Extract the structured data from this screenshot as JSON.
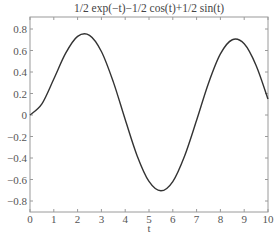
{
  "chart_data": {
    "type": "line",
    "title": "1/2 exp(−t)−1/2 cos(t)+1/2 sin(t)",
    "xlabel": "t",
    "ylabel": "",
    "xlim": [
      0,
      10
    ],
    "ylim": [
      -0.88,
      0.9
    ],
    "grid": false,
    "legend": null,
    "x_ticks": [
      0,
      1,
      2,
      3,
      4,
      5,
      6,
      7,
      8,
      9,
      10
    ],
    "x_tick_labels": [
      "0",
      "1",
      "2",
      "3",
      "4",
      "5",
      "6",
      "7",
      "8",
      "9",
      "10"
    ],
    "y_ticks": [
      0.8,
      0.6,
      0.4,
      0.2,
      0,
      -0.2,
      -0.4,
      -0.6,
      -0.8
    ],
    "y_tick_labels": [
      "0.8",
      "0.6",
      "0.4",
      "0.2",
      "0",
      "−0.2",
      "−0.4",
      "−0.6",
      "−0.8"
    ],
    "series": [
      {
        "name": "1/2 exp(-t)-1/2 cos(t)+1/2 sin(t)",
        "color": "#333333",
        "x": [
          0,
          0.5,
          1,
          1.5,
          2,
          2.5,
          3,
          3.5,
          4,
          4.5,
          5,
          5.5,
          6,
          6.5,
          7,
          7.5,
          8,
          8.5,
          9,
          9.5,
          10
        ],
        "y": [
          0,
          0.104,
          0.335,
          0.575,
          0.731,
          0.741,
          0.591,
          0.308,
          -0.042,
          -0.378,
          -0.618,
          -0.705,
          -0.619,
          -0.379,
          -0.049,
          0.296,
          0.568,
          0.7,
          0.662,
          0.461,
          0.148
        ]
      }
    ]
  },
  "layout": {
    "plot_left": 30,
    "plot_right": 268,
    "plot_top": 17,
    "plot_bottom": 212,
    "y_zero_px": 115,
    "y_px_per_unit": 107.5
  }
}
